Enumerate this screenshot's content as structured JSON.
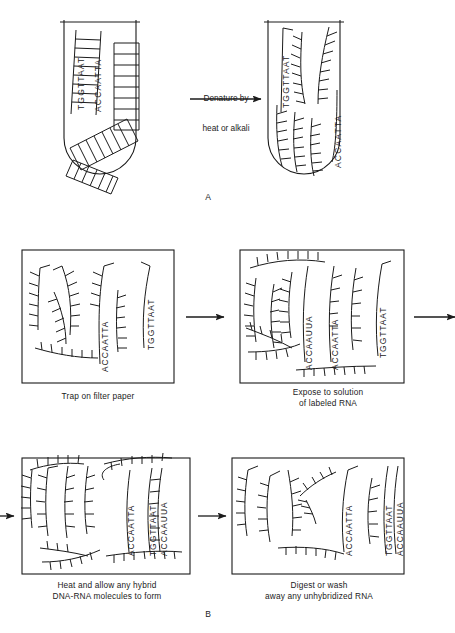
{
  "figure": {
    "width": 455,
    "height": 633,
    "ink_color": "#1b1b1b",
    "background_color": "#ffffff"
  },
  "panel_a": {
    "letter": "A",
    "left_tube": {
      "label": "native double-stranded DNA in tube",
      "sequence_top": "TGGTTAAT",
      "sequence_bottom": "ACCAATTA"
    },
    "transition": {
      "line1": "Denature by",
      "line2": "heat or alkali",
      "icon": "right-arrow-icon"
    },
    "right_tube": {
      "label": "denatured single-stranded DNA in tube",
      "sequence_strand_1": "TGGTTAAT",
      "sequence_strand_2": "ACCAATTA"
    }
  },
  "panel_b": {
    "letter": "B",
    "steps": [
      {
        "id": "trap",
        "caption": "Trap on filter paper",
        "labels": [
          "ACCAATTA",
          "TGGTTAAT"
        ]
      },
      {
        "id": "expose",
        "caption": "Expose to solution\nof labeled RNA",
        "labels": [
          "ACCAAUUA",
          "ACCAATTA",
          "TGGTTAAT"
        ]
      },
      {
        "id": "hybridize",
        "caption": "Heat and allow any hybrid\nDNA-RNA molecules to form",
        "labels": [
          "ACCAATTA",
          "TGGTTAAT",
          "ACCAAUUA"
        ]
      },
      {
        "id": "digest",
        "caption": "Digest or wash\naway any unhybridized RNA",
        "labels": [
          "ACCAATTA",
          "TGGTTAAT",
          "ACCAAUUA"
        ]
      }
    ],
    "arrows": [
      {
        "id": "arrow-trap-to-expose",
        "icon": "right-arrow-icon"
      },
      {
        "id": "arrow-expose-wrap-out",
        "icon": "right-arrow-icon"
      },
      {
        "id": "arrow-wrap-in-to-hybridize",
        "icon": "right-arrow-icon"
      },
      {
        "id": "arrow-hybridize-to-digest",
        "icon": "right-arrow-icon"
      }
    ]
  }
}
